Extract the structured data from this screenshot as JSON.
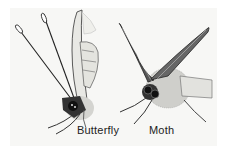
{
  "figure": {
    "labels": {
      "butterfly": "Butterfly",
      "moth": "Moth"
    },
    "colors": {
      "background": "#f7f7f5",
      "ink": "#222222",
      "shading": "#9a9a96"
    }
  }
}
